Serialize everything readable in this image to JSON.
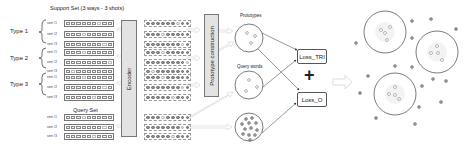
{
  "support_set": {
    "title": "Support Set (3 ways - 3 shots)",
    "types": [
      {
        "label": "Type 1",
        "rows": [
          "sent #1",
          "sent #2",
          "sent #3"
        ]
      },
      {
        "label": "Type 2",
        "rows": [
          "sent #1",
          "sent #2",
          "sent #3"
        ]
      },
      {
        "label": "Type 3",
        "rows": [
          "sent #1",
          "sent #2",
          "sent #3"
        ]
      }
    ]
  },
  "query_set": {
    "title": "Query Set",
    "rows": [
      "sent #1",
      "sent #2",
      "sent #3"
    ]
  },
  "encoder": {
    "label": "Encoder"
  },
  "prototype_construction": {
    "label": "Prototype construction"
  },
  "prototypes": {
    "label": "Prototypes"
  },
  "query_words": {
    "label": "Query words"
  },
  "losses": {
    "tri": "Loss_TRI",
    "plus": "+",
    "o": "Loss_O"
  },
  "colors": {
    "box_fill": "#e3e3e3",
    "stroke": "#555555",
    "dot": "#8c8c8c",
    "arrow": "#d8d8d8"
  }
}
